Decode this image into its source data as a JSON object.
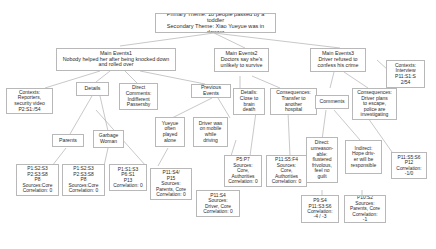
{
  "diagram": {
    "type": "tree",
    "nodes": {
      "root": {
        "label": "Primary Theme: 18 people passed by a toddler\nSecondary Theme: Xiao Yueyue was in danger"
      },
      "main1": {
        "label": "Main Events1\nNobody helped her after being knocked down\nand rolled over"
      },
      "main2": {
        "label": "Main Events2\nDoctors say she's\nunlikely to survive"
      },
      "main3": {
        "label": "Main Events3\nDriver refused to\nconfess his crime"
      },
      "contexts_interview": {
        "label": "Contexts:\nInterview\nP11:S1:S\n2/54"
      },
      "contexts_reporters": {
        "label": "Contexts:\nReporters,\nsecurity video\nP2:S1:/54"
      },
      "details1": {
        "label": "Details"
      },
      "direct_comments": {
        "label": "Direct\nComments:\nIndifferent\nPassersby"
      },
      "previous_events": {
        "label": "Previous\nEvents"
      },
      "details2": {
        "label": "Details:\nClose to\nbrain\ndeath"
      },
      "consequences2": {
        "label": "Consequences:\nTransfer to\nanother\nhospital"
      },
      "comments3": {
        "label": "Comments"
      },
      "consequences3": {
        "label": "Consequences:\nDriver plans\nto escape,\npolice are\ninvestigating"
      },
      "parents": {
        "label": "Parents"
      },
      "garbage_woman": {
        "label": "Garbage\nWoman"
      },
      "yueyue_alone": {
        "label": "Yueyue\noften\nplayed\nalone"
      },
      "driver_mobile": {
        "label": "Driver was\non mobile\nwhile\ndriving"
      },
      "direct_unreasonable": {
        "label": "Direct:\nunreason-\nable:\nflustered\nfrivolous,\nfeel no\nguilt"
      },
      "indirect_hope": {
        "label": "Indirect:\nHope driv-\ner will be\nresponsible"
      },
      "data_parents": {
        "label": "P1:S2:S3\nP2:S3:S8\nP8\nSources:Core\nCorrelation: 0"
      },
      "data_garbage": {
        "label": "P1:S2:S3\nP2:S3:S8\nP8\nSources:Core\nCorrelation: 0"
      },
      "data_direct": {
        "label": "P1:S1:S3\nP6:S1\nP13\nCorrelation: 0"
      },
      "data_alone": {
        "label": "P11:S4/\nP15\nSources:\nParents, Core\nCorrelation: 0"
      },
      "data_details2": {
        "label": "P5:P7\nSources:\nCore,\nAuthorities\nCorrelation: 0"
      },
      "data_conseq2": {
        "label": "P11:S5:F4\nSources:\nCore,\nAuthorities\nCorrelation: 0"
      },
      "data_driver": {
        "label": "P11:S4\nSources:\nDriver, Core\nCorrelation: 0"
      },
      "data_unreason": {
        "label": "P9:S4\nP11:S3:S6\nCorrelation:\n-4 / -3"
      },
      "data_indirect": {
        "label": "P10:S2\nSources:\nParents, Core\nCorrelation:\n-1"
      },
      "data_conseq3": {
        "label": "P11:S5:S6\nP12\nCorrelation:\n-1/0"
      }
    }
  }
}
